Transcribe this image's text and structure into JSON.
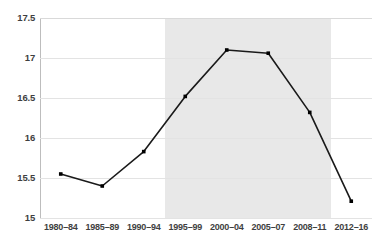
{
  "chart_data": {
    "type": "line",
    "title": "",
    "subtitle": "",
    "xlabel": "",
    "ylabel": "",
    "categories": [
      "1980–84",
      "1985–89",
      "1990–94",
      "1995–99",
      "2000–04",
      "2005–07",
      "2008–11",
      "2012–16"
    ],
    "values": [
      15.55,
      15.4,
      15.83,
      16.52,
      17.1,
      17.06,
      16.32,
      15.21
    ],
    "series": [
      {
        "name": "",
        "values": [
          15.55,
          15.4,
          15.83,
          16.52,
          17.1,
          17.06,
          16.32,
          15.21
        ]
      }
    ],
    "ylim": [
      15,
      17.5
    ],
    "yticks": [
      15,
      15.5,
      16,
      16.5,
      17,
      17.5
    ],
    "ytick_labels": [
      "15",
      "15.5",
      "16",
      "16.5",
      "17",
      "17.5"
    ],
    "grid": "horizontal",
    "legend": "none",
    "markers": "square",
    "line_color": "#1a1a1a",
    "marker_color": "#000000",
    "grid_color": "#e3e3e3",
    "axis_color": "#bdbdbd",
    "text_color": "#3f3f3f",
    "background_color": "#ffffff",
    "highlight_band": {
      "label": "",
      "start_category": "1995–99",
      "end_category": "2008–11",
      "color": "#e8e8e8"
    },
    "annotations": []
  }
}
